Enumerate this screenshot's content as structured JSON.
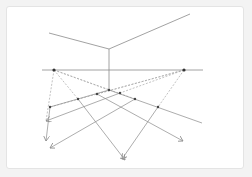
{
  "diagram": {
    "colors": {
      "background": "#f3f3f3",
      "canvas": "#ffffff",
      "line": "#8a8a8a",
      "dashed": "#a8a8a8",
      "dot": "#333333"
    },
    "horizon": {
      "x1": 42,
      "y1": 70,
      "x2": 203,
      "y2": 70
    },
    "vanishing_points": [
      {
        "name": "left-vp",
        "x": 54,
        "y": 70
      },
      {
        "name": "right-vp",
        "x": 184,
        "y": 70
      }
    ],
    "roof_edges": [
      {
        "x1": 49,
        "y1": 33,
        "x2": 109,
        "y2": 49
      },
      {
        "x1": 109,
        "y1": 49,
        "x2": 190,
        "y2": 14
      }
    ],
    "vertical_edge": {
      "x1": 109,
      "y1": 49,
      "x2": 109,
      "y2": 90
    },
    "grid_dots": [
      {
        "x": 50,
        "y": 107
      },
      {
        "x": 78,
        "y": 99
      },
      {
        "x": 97,
        "y": 94
      },
      {
        "x": 109,
        "y": 90
      },
      {
        "x": 120,
        "y": 93
      },
      {
        "x": 135,
        "y": 99
      },
      {
        "x": 158,
        "y": 107
      }
    ]
  }
}
